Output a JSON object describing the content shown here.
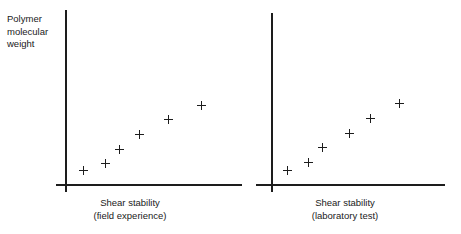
{
  "figure": {
    "background_color": "#ffffff",
    "ink_color": "#1d1d1d",
    "marker_glyph": "plus"
  },
  "chart_data": [
    {
      "type": "scatter",
      "title": "",
      "panel_id": "field-experience",
      "xlabel_line1": "Shear stability",
      "xlabel_line2": "(field experience)",
      "ylabel_line1": "Polymer",
      "ylabel_line2": "molecular",
      "ylabel_line3": "weight",
      "grid": false,
      "legend": "none",
      "axis_ticks": false,
      "xlim": [
        0,
        1
      ],
      "ylim": [
        0,
        1
      ],
      "x": [
        0.1,
        0.23,
        0.31,
        0.42,
        0.58,
        0.77
      ],
      "y": [
        0.08,
        0.12,
        0.2,
        0.28,
        0.37,
        0.45
      ],
      "points_px": [
        {
          "x": 83,
          "y": 170
        },
        {
          "x": 105,
          "y": 163
        },
        {
          "x": 119,
          "y": 149
        },
        {
          "x": 139,
          "y": 134
        },
        {
          "x": 168,
          "y": 119
        },
        {
          "x": 201,
          "y": 105
        }
      ]
    },
    {
      "type": "scatter",
      "title": "",
      "panel_id": "laboratory-test",
      "xlabel_line1": "Shear stability",
      "xlabel_line2": "(laboratory test)",
      "ylabel_line1": "",
      "ylabel_line2": "",
      "ylabel_line3": "",
      "grid": false,
      "legend": "none",
      "axis_ticks": false,
      "xlim": [
        0,
        1
      ],
      "ylim": [
        0,
        1
      ],
      "x": [
        0.09,
        0.21,
        0.29,
        0.45,
        0.57,
        0.74
      ],
      "y": [
        0.08,
        0.13,
        0.21,
        0.29,
        0.38,
        0.46
      ],
      "points_px": [
        {
          "x": 57,
          "y": 170
        },
        {
          "x": 78,
          "y": 162
        },
        {
          "x": 92,
          "y": 147
        },
        {
          "x": 119,
          "y": 133
        },
        {
          "x": 140,
          "y": 118
        },
        {
          "x": 169,
          "y": 103
        }
      ]
    }
  ],
  "left_panel": {
    "ylabel": {
      "line1": "Polymer",
      "line2": "molecular",
      "line3": "weight"
    },
    "xlabel": {
      "line1": "Shear stability",
      "line2": "(field experience)"
    }
  },
  "right_panel": {
    "xlabel": {
      "line1": "Shear stability",
      "line2": "(laboratory test)"
    }
  }
}
